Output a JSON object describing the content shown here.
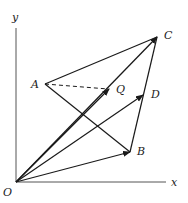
{
  "diagram": {
    "title": "",
    "axes": {
      "x_label": "x",
      "y_label": "y",
      "origin_label": "O"
    },
    "points": {
      "O": {
        "label": "O",
        "x": 16,
        "y": 182
      },
      "A": {
        "label": "A",
        "x": 45,
        "y": 84
      },
      "B": {
        "label": "B",
        "x": 130,
        "y": 152
      },
      "C": {
        "label": "C",
        "x": 157,
        "y": 37
      },
      "D": {
        "label": "D",
        "x": 143,
        "y": 95
      },
      "Q": {
        "label": "Q",
        "x": 109,
        "y": 89
      }
    },
    "segments": [
      {
        "from": "A",
        "to": "C",
        "style": "solid"
      },
      {
        "from": "A",
        "to": "B",
        "style": "solid"
      },
      {
        "from": "A",
        "to": "Q",
        "style": "dashed"
      },
      {
        "from": "B",
        "to": "C",
        "style": "solid"
      }
    ],
    "vectors": [
      {
        "from": "O",
        "to": "C"
      },
      {
        "from": "O",
        "to": "Q"
      },
      {
        "from": "O",
        "to": "D"
      },
      {
        "from": "O",
        "to": "B"
      }
    ],
    "colors": {
      "stroke": "#1a1a1a",
      "axis": "#555555",
      "background": "#ffffff"
    }
  }
}
